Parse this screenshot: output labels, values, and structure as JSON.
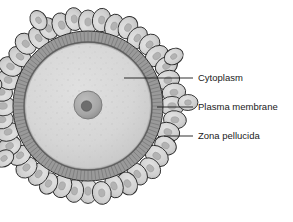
{
  "figure": {
    "background_color": "#ffffff",
    "width": 293,
    "height": 222
  },
  "colors": {
    "cytoplasm": "#d5d5d5",
    "cytoplasm_edge": "#c2c2c2",
    "zona_pellucida": "#9a9a9a",
    "zona_striation": "#7e7e7e",
    "plasma_membrane": "#6f6f6f",
    "corona_cell_fill": "#d2d2d2",
    "corona_cell_nucleus": "#b0b0b0",
    "nucleus_fill": "#a8a8a8",
    "nucleolus_fill": "#6e6e6e",
    "outline": "#2b2b2b",
    "leader_line": "#1a1a1a",
    "label_text": "#1a1a1a"
  },
  "structures": [
    {
      "id": "corona-radiata",
      "name": "corona radiata",
      "description": "ring of oval follicular cells surrounding the oocyte",
      "cell_count": 40
    },
    {
      "id": "zona-pellucida",
      "name": "Zona pellucida",
      "description": "radially striated glycoprotein band",
      "outer_radius": 75,
      "inner_radius": 64
    },
    {
      "id": "plasma-membrane",
      "name": "Plasma membrane",
      "description": "boundary at the inner edge of the zona pellucida",
      "radius": 64
    },
    {
      "id": "cytoplasm",
      "name": "Cytoplasm",
      "description": "stippled ooplasm filling the oocyte",
      "radius": 62
    },
    {
      "id": "nucleus",
      "name": "nucleus",
      "description": "central nucleus containing a nucleolus",
      "radius": 14
    },
    {
      "id": "nucleolus",
      "name": "nucleolus",
      "radius": 5
    }
  ],
  "labels": [
    {
      "id": "cytoplasm",
      "text": "Cytoplasm",
      "text_x": 198,
      "text_y": 78,
      "leader": {
        "x1": 124,
        "y1": 78,
        "x2": 193,
        "y2": 78
      }
    },
    {
      "id": "plasma-membrane",
      "text": "Plasma membrane",
      "text_x": 198,
      "text_y": 107,
      "leader": {
        "x1": 157,
        "y1": 107,
        "x2": 193,
        "y2": 107
      }
    },
    {
      "id": "zona-pellucida",
      "text": "Zona pellucida",
      "text_x": 198,
      "text_y": 136,
      "leader": {
        "x1": 164,
        "y1": 136,
        "x2": 193,
        "y2": 136
      }
    }
  ],
  "geometry": {
    "center_x": 88,
    "center_y": 106,
    "nucleus_x": 88,
    "nucleus_y": 105
  }
}
